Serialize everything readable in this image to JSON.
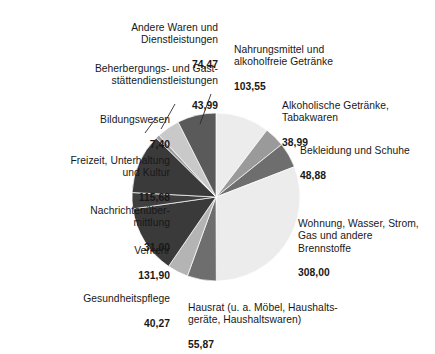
{
  "chart_data": {
    "type": "pie",
    "title": "",
    "subtitle": "",
    "unit": "EUR",
    "total": 1000.0,
    "legend_position": "callout-labels",
    "grid": false,
    "categories": [
      "Nahrungsmittel und alkoholfreie Getränke",
      "Alkoholische Getränke, Tabakwaren",
      "Bekleidung und Schuhe",
      "Wohnung, Wasser, Strom, Gas und andere Brennstoffe",
      "Hausrat (u. a. Möbel, Haushaltsgeräte, Haushaltswaren)",
      "Gesundheitspflege",
      "Verkehr",
      "Nachrichtenübermittlung",
      "Freizeit, Unterhaltung und Kultur",
      "Bildungswesen",
      "Beherbergungs- und Gaststättendienstleistungen",
      "Andere Waren und Dienstleistungen"
    ],
    "values": [
      103.55,
      38.99,
      48.88,
      308.0,
      55.87,
      40.27,
      131.9,
      31.0,
      115.68,
      7.4,
      43.99,
      74.47
    ],
    "value_labels": [
      "103,55",
      "38,99",
      "48,88",
      "308,00",
      "55,87",
      "40,27",
      "131,90",
      "31,00",
      "115,68",
      "7,40",
      "43,99",
      "74,47"
    ],
    "colors": [
      "#ececec",
      "#9a9a9a",
      "#6e6e6e",
      "#ececec",
      "#6e6e6e",
      "#b4b4b4",
      "#3a3a3a",
      "#3f3f3f",
      "#3a3a3a",
      "#9a9a9a",
      "#c9c9c9",
      "#5a5a5a"
    ]
  },
  "slices": [
    {
      "id": "nahrung",
      "name": "slice-nahrungsmittel",
      "label_lines": "Nahrungsmittel und\nalkoholfreie Getränke",
      "value": "103,55",
      "color": "#ececec",
      "align": "left"
    },
    {
      "id": "alkohol",
      "name": "slice-alkoholische-getraenke",
      "label_lines": "Alkoholische Getränke,\nTabakwaren",
      "value": "38,99",
      "color": "#9a9a9a",
      "align": "left"
    },
    {
      "id": "bekleidung",
      "name": "slice-bekleidung",
      "label_lines": "Bekleidung und Schuhe",
      "value": "48,88",
      "color": "#6e6e6e",
      "align": "left"
    },
    {
      "id": "wohnung",
      "name": "slice-wohnung",
      "label_lines": "Wohnung, Wasser, Strom,\nGas und andere\nBrennstoffe",
      "value": "308,00",
      "color": "#ececec",
      "align": "left"
    },
    {
      "id": "hausrat",
      "name": "slice-hausrat",
      "label_lines": "Hausrat (u. a. Möbel, Haushalts-\ngeräte, Haushaltswaren)",
      "value": "55,87",
      "color": "#6e6e6e",
      "align": "left"
    },
    {
      "id": "gesundheit",
      "name": "slice-gesundheitspflege",
      "label_lines": "Gesundheitspflege",
      "value": "40,27",
      "color": "#b4b4b4",
      "align": "right"
    },
    {
      "id": "verkehr",
      "name": "slice-verkehr",
      "label_lines": "Verkehr",
      "value": "131,90",
      "color": "#3a3a3a",
      "align": "right"
    },
    {
      "id": "nachrichten",
      "name": "slice-nachrichtenuebermittlung",
      "label_lines": "Nachrichtenüber-\nmittlung",
      "value": "31,00",
      "color": "#3f3f3f",
      "align": "right"
    },
    {
      "id": "freizeit",
      "name": "slice-freizeit",
      "label_lines": "Freizeit, Unterhaltung\nund Kultur",
      "value": "115,68",
      "color": "#3a3a3a",
      "align": "right"
    },
    {
      "id": "bildung",
      "name": "slice-bildungswesen",
      "label_lines": "Bildungswesen",
      "value": "7,40",
      "color": "#9a9a9a",
      "align": "right"
    },
    {
      "id": "beherbergung",
      "name": "slice-beherbergung",
      "label_lines": "Beherbergungs- und Gast-\nstättendienstleistungen",
      "value": "43,99",
      "color": "#c9c9c9",
      "align": "right"
    },
    {
      "id": "andere",
      "name": "slice-andere-waren",
      "label_lines": "Andere Waren und\nDienstleistungen",
      "value": "74,47",
      "color": "#5a5a5a",
      "align": "right"
    }
  ]
}
